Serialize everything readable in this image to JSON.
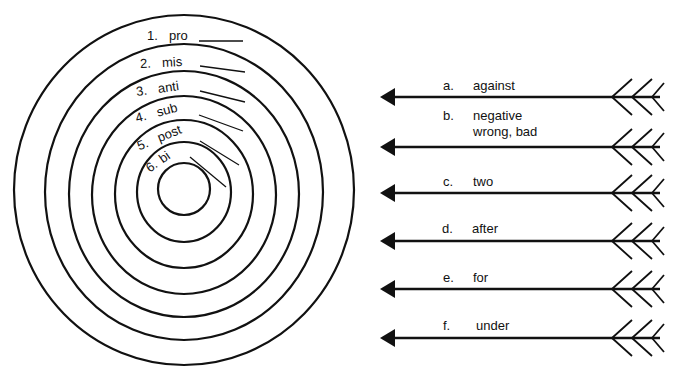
{
  "target": {
    "center": [
      184,
      190
    ],
    "rings": [
      {
        "rx": 170,
        "ry": 175
      },
      {
        "rx": 139,
        "ry": 150
      },
      {
        "rx": 115,
        "ry": 124
      },
      {
        "rx": 92,
        "ry": 99
      },
      {
        "rx": 69,
        "ry": 74
      },
      {
        "rx": 47,
        "ry": 50
      },
      {
        "rx": 26,
        "ry": 27
      }
    ],
    "prefixes": [
      {
        "number": "1.",
        "text": "pro"
      },
      {
        "number": "2.",
        "text": "mis"
      },
      {
        "number": "3.",
        "text": "anti"
      },
      {
        "number": "4.",
        "text": "sub"
      },
      {
        "number": "5.",
        "text": "post"
      },
      {
        "number": "6.",
        "text": "bi"
      }
    ]
  },
  "arrows": [
    {
      "letter": "a.",
      "meaning": "against",
      "y": 97
    },
    {
      "letter": "b.",
      "meaning": "negative",
      "meaning2": "wrong, bad",
      "y": 147
    },
    {
      "letter": "c.",
      "meaning": "two",
      "y": 193
    },
    {
      "letter": "d.",
      "meaning": "after",
      "y": 241
    },
    {
      "letter": "e.",
      "meaning": "for",
      "y": 289
    },
    {
      "letter": "f.",
      "meaning": "under",
      "y": 338
    }
  ]
}
